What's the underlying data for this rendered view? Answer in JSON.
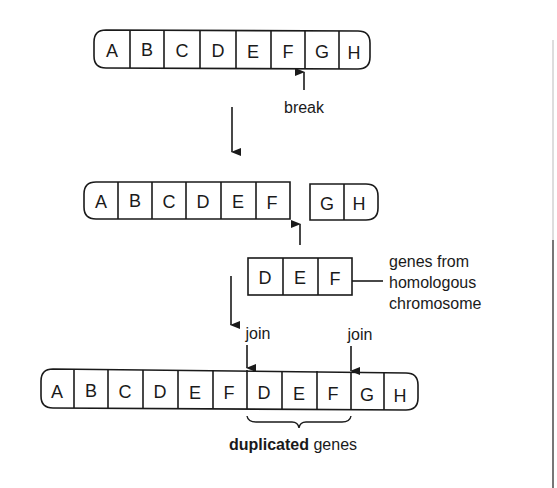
{
  "diagram": {
    "stage1": {
      "name": "original-chromosome",
      "genes": [
        "A",
        "B",
        "C",
        "D",
        "E",
        "F",
        "G",
        "H"
      ],
      "break_label": "break",
      "break_between": [
        "F",
        "G"
      ]
    },
    "stage2": {
      "name": "broken-chromosome",
      "left_genes": [
        "A",
        "B",
        "C",
        "D",
        "E",
        "F"
      ],
      "right_genes": [
        "G",
        "H"
      ],
      "insert_genes": [
        "D",
        "E",
        "F"
      ],
      "insert_label_lines": [
        "genes from",
        "homologous",
        "chromosome"
      ]
    },
    "stage3": {
      "name": "result-chromosome",
      "genes": [
        "A",
        "B",
        "C",
        "D",
        "E",
        "F",
        "D",
        "E",
        "F",
        "G",
        "H"
      ],
      "join_label_left": "join",
      "join_label_right": "join",
      "duplicated_bold": "duplicated",
      "duplicated_rest": " genes"
    },
    "colors": {
      "ink": "#1a1a1a",
      "background": "#ffffff"
    }
  }
}
